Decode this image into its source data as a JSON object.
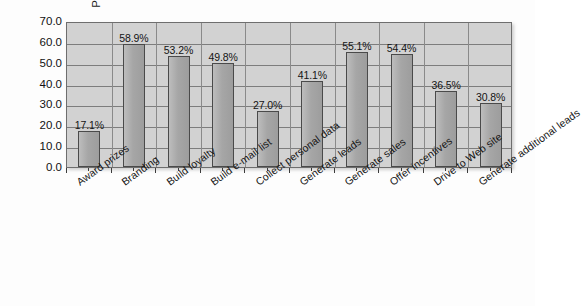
{
  "chart_data": {
    "type": "bar",
    "title": "",
    "subtitle": "",
    "xlabel": "",
    "ylabel": "Percent of Total",
    "ylim": [
      0,
      70
    ],
    "ytick_step": 10,
    "ytick_labels": [
      "70.0",
      "60.0",
      "50.0",
      "40.0",
      "30.0",
      "20.0",
      "10.0",
      "0.0"
    ],
    "grid": "horizontal-and-vertical",
    "legend": "none",
    "value_label_suffix": "%",
    "categories": [
      "Award prizes",
      "Branding",
      "Build loyalty",
      "Build e-mail list",
      "Collect personal data",
      "Generate leads",
      "Generate sales",
      "Offer incentives",
      "Drive to Web site",
      "Generate additional leads"
    ],
    "values": [
      17.1,
      58.9,
      53.2,
      49.8,
      27.0,
      41.1,
      55.1,
      54.4,
      36.5,
      30.8
    ],
    "value_labels": [
      "17.1%",
      "58.9%",
      "53.2%",
      "49.8%",
      "27.0%",
      "41.1%",
      "55.1%",
      "54.4%",
      "36.5%",
      "30.8%"
    ],
    "colors": {
      "bar_fill": "#ababab",
      "bar_border": "#4a4a4a",
      "plot_background": "#d2d2d2",
      "gridline": "#7d7d7d",
      "frame_border": "#6e6e6e",
      "text": "#141414",
      "page_background": "#ffffff"
    }
  }
}
